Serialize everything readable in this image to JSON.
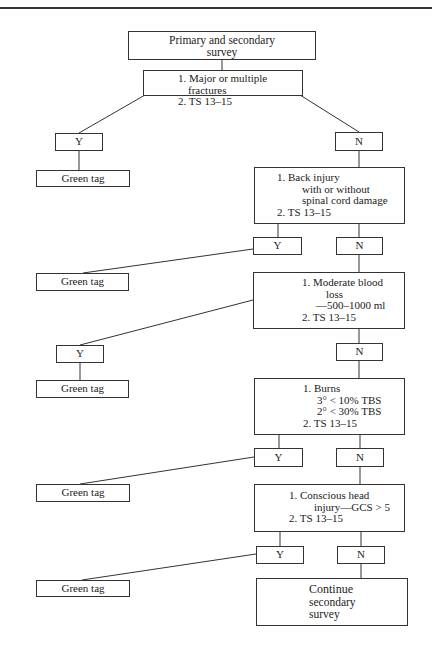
{
  "diagram": {
    "start": {
      "lines": [
        "Primary and secondary",
        "survey"
      ]
    },
    "decisions": [
      {
        "id": "fractures",
        "lines": [
          "1.  Major or multiple",
          "fractures",
          "2.  TS 13–15"
        ]
      },
      {
        "id": "back",
        "lines": [
          "1.  Back injury",
          "with or without",
          "spinal cord damage",
          "2.  TS 13–15"
        ]
      },
      {
        "id": "blood",
        "lines": [
          "1.  Moderate blood",
          "loss",
          "—500–1000 ml",
          "2.  TS 13–15"
        ]
      },
      {
        "id": "burns",
        "lines": [
          "1.  Burns",
          "3° < 10% TBS",
          "2° < 30% TBS",
          "2.  TS 13–15"
        ]
      },
      {
        "id": "head",
        "lines": [
          "1.  Conscious head",
          "injury—GCS > 5",
          "2.  TS 13–15"
        ]
      }
    ],
    "yes_label": "Y",
    "no_label": "N",
    "outcome_yes": "Green tag",
    "end": {
      "lines": [
        "Continue",
        "secondary",
        "survey"
      ]
    }
  }
}
